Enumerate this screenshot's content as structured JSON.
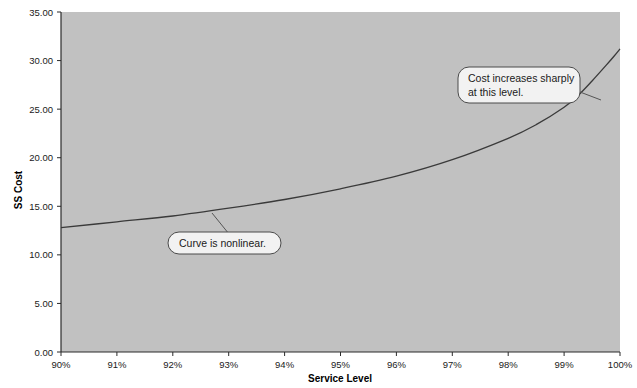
{
  "chart_data": {
    "type": "line",
    "title": "",
    "xlabel": "Service Level",
    "ylabel": "SS Cost",
    "xlim": [
      90,
      100
    ],
    "ylim": [
      0,
      35
    ],
    "grid": false,
    "legend": null,
    "plot_background": "#c1c1c1",
    "line_color": "#3a3a3a",
    "x_tick_labels": [
      "90%",
      "91%",
      "92%",
      "93%",
      "94%",
      "95%",
      "96%",
      "97%",
      "98%",
      "99%",
      "100%"
    ],
    "x_ticks": [
      90,
      91,
      92,
      93,
      94,
      95,
      96,
      97,
      98,
      99,
      100
    ],
    "y_tick_labels": [
      "0.00",
      "5.00",
      "10.00",
      "15.00",
      "20.00",
      "25.00",
      "30.00",
      "35.00"
    ],
    "y_ticks": [
      0,
      5,
      10,
      15,
      20,
      25,
      30,
      35
    ],
    "series": [
      {
        "name": "SS Cost",
        "x": [
          90,
          91,
          92,
          93,
          94,
          95,
          96,
          97,
          98,
          98.5,
          99,
          99.25,
          99.5,
          99.75,
          99.9,
          100
        ],
        "values": [
          12.8,
          13.4,
          14.0,
          14.8,
          15.7,
          16.8,
          18.1,
          19.8,
          22.0,
          23.4,
          25.2,
          26.4,
          27.9,
          29.5,
          30.5,
          31.2
        ]
      }
    ],
    "annotations": [
      {
        "id": "annotation-nonlinear",
        "lines": [
          "Curve is nonlinear."
        ],
        "anchor_x": 92.6,
        "anchor_y": 14.55
      },
      {
        "id": "annotation-cost-increase",
        "lines": [
          "Cost increases sharply",
          "at this level."
        ],
        "anchor_x": 99.5,
        "anchor_y": 27.9
      }
    ]
  }
}
